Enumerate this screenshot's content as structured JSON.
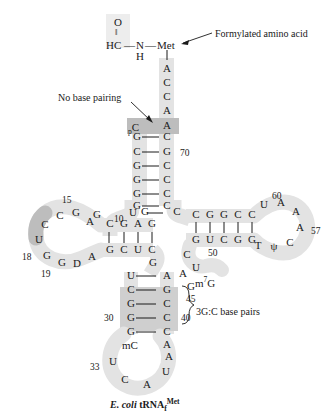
{
  "figure": {
    "caption_prefix": "E. ",
    "caption_italic": "coli",
    "caption_main": " tRNA",
    "caption_sub": "f",
    "caption_sup": "Met"
  },
  "annotations": {
    "formylated": "Formylated amino acid",
    "no_base_pairing": "No base pairing",
    "gc_base_pairs": "3G:C base pairs"
  },
  "chem": {
    "O": "O",
    "double_bond": "||",
    "HC": "HC",
    "dash1": "—",
    "N": "N",
    "dash2": "—",
    "Met": "Met",
    "H": "H"
  },
  "acceptor_3prime": [
    "A",
    "C",
    "C",
    "A",
    "A"
  ],
  "acceptor_stem": {
    "mismatch_left": "C",
    "mismatch_left_prefix": "p",
    "mismatch_right": "A",
    "pairs": [
      {
        "left": "G",
        "right": "C"
      },
      {
        "left": "C",
        "right": "G"
      },
      {
        "left": "G",
        "right": "C"
      },
      {
        "left": "G",
        "right": "C"
      },
      {
        "left": "G",
        "right": "C"
      },
      {
        "left": "G",
        "right": "C"
      }
    ],
    "number_70": "70"
  },
  "junction": {
    "left_U": "U",
    "pair_G": "G",
    "pair_C": "C"
  },
  "d_arm": {
    "stem_top": [
      "C",
      "G",
      "A",
      "G"
    ],
    "stem_bottom": [
      "G",
      "C",
      "U",
      "C"
    ],
    "loop": [
      "U",
      "C",
      "C",
      "G",
      "A",
      "G",
      "G",
      "D",
      "A"
    ],
    "number_10": "10",
    "number_15": "15",
    "number_18": "18",
    "number_19": "19",
    "junction_G_left": "G",
    "junction_G_below": "G"
  },
  "t_arm": {
    "stem_top": [
      "C",
      "G",
      "G",
      "C",
      "C"
    ],
    "stem_bottom": [
      "G",
      "U",
      "C",
      "G",
      "G"
    ],
    "loop": [
      "U",
      "A",
      "A",
      "A",
      "C",
      "Psi",
      "T"
    ],
    "loop_display": [
      "U",
      "A",
      "A",
      "A",
      "C",
      "ψ",
      "T"
    ],
    "number_50": "50",
    "number_57": "57",
    "number_60": "60"
  },
  "variable_loop": {
    "C": "C",
    "U": "U",
    "m7G": "m",
    "m7G_sup": "7",
    "m7G_tail": "G",
    "A": "A",
    "G": "G",
    "number_45": "45"
  },
  "anticodon_arm": {
    "stem_pairs": [
      {
        "left": "U",
        "right": "A",
        "shaded": false
      },
      {
        "left": "C",
        "right": "G",
        "shaded": false
      },
      {
        "left": "G",
        "right": "C",
        "shaded": true
      },
      {
        "left": "G",
        "right": "C",
        "shaded": true
      },
      {
        "left": "G",
        "right": "C",
        "shaded": true
      }
    ],
    "mC_prefix": "m",
    "mC": "C",
    "right_A": "A",
    "loop": [
      "U",
      "C",
      "A",
      "U",
      "A"
    ],
    "number_30": "30",
    "number_40": "40",
    "number_33": "33"
  },
  "colors": {
    "backbone_shade": "#e0e0e0",
    "dark_shade": "#b8b8b8",
    "text": "#1a1a1a",
    "background": "#ffffff"
  }
}
